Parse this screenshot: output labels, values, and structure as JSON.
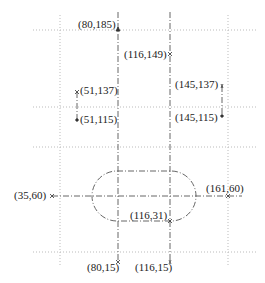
{
  "diagram": {
    "type": "coordinate-annotated-sketch",
    "points": [
      {
        "id": "p1",
        "label": "(80,185)",
        "x": 80,
        "y": 185
      },
      {
        "id": "p2",
        "label": "(116,149)",
        "x": 116,
        "y": 149
      },
      {
        "id": "p3",
        "label": "(51,137)",
        "x": 51,
        "y": 137
      },
      {
        "id": "p4",
        "label": "(51,115)",
        "x": 51,
        "y": 115
      },
      {
        "id": "p5",
        "label": "(145,137)",
        "x": 145,
        "y": 137
      },
      {
        "id": "p6",
        "label": "(145,115)",
        "x": 145,
        "y": 115
      },
      {
        "id": "p7",
        "label": "(35,60)",
        "x": 35,
        "y": 60
      },
      {
        "id": "p8",
        "label": "(161,60)",
        "x": 161,
        "y": 60
      },
      {
        "id": "p9",
        "label": "(116,31)",
        "x": 116,
        "y": 31
      },
      {
        "id": "p10",
        "label": "(80,15)",
        "x": 80,
        "y": 15
      },
      {
        "id": "p11",
        "label": "(116,15)",
        "x": 116,
        "y": 15
      }
    ],
    "shapes": [
      {
        "id": "stadium",
        "kind": "rounded-slot",
        "center_y": 60,
        "x_range": [
          80,
          116
        ],
        "top_y": 89,
        "bottom_y": 31
      }
    ],
    "colors": {
      "line": "#555555",
      "grid": "#bbbbbb",
      "text": "#222222"
    }
  }
}
